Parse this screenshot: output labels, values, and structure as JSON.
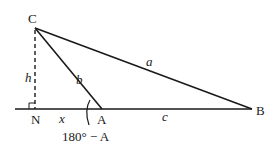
{
  "diagram": {
    "type": "triangle-obtuse-with-altitude",
    "vertices": {
      "C": {
        "label": "C"
      },
      "A": {
        "label": "A"
      },
      "B": {
        "label": "B"
      },
      "N": {
        "label": "N"
      }
    },
    "sides": {
      "a": {
        "label": "a",
        "from": "C",
        "to": "B"
      },
      "b": {
        "label": "b",
        "from": "C",
        "to": "A"
      },
      "c": {
        "label": "c",
        "from": "A",
        "to": "B"
      }
    },
    "altitude": {
      "label": "h",
      "from": "C",
      "to": "N",
      "style": "dashed"
    },
    "segment_x": {
      "label": "x",
      "from": "N",
      "to": "A"
    },
    "exterior_angle": {
      "label": "180° − A",
      "at": "A"
    },
    "right_angle_marker_at": "N",
    "colors": {
      "stroke": "#1a1a1a",
      "background": "#ffffff"
    }
  }
}
